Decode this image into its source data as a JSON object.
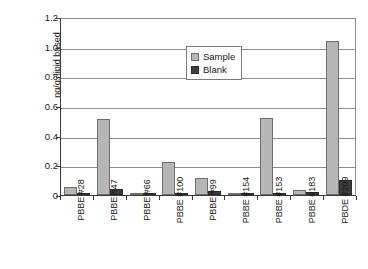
{
  "chart_data": {
    "type": "bar",
    "title": "",
    "xlabel": "",
    "ylabel": "ng/g, lipid based",
    "ylim": [
      0,
      1.2
    ],
    "yticks": [
      "0",
      "0.2",
      "0.4",
      "0.6",
      "0.8",
      "1.0",
      "1.2"
    ],
    "ytick_values": [
      0,
      0.2,
      0.4,
      0.6,
      0.8,
      1.0,
      1.2
    ],
    "grid": true,
    "legend_position": "upper center",
    "categories": [
      "PBBE #28",
      "PBBE #47",
      "PBBE #66",
      "PBBE #100",
      "PBBE #99",
      "PBBE #154",
      "PBBE #153",
      "PBBE #183",
      "PBDE #209"
    ],
    "series": [
      {
        "name": "Sample",
        "color": "#b6b6b6",
        "values": [
          0.055,
          0.512,
          0.008,
          0.221,
          0.114,
          0.012,
          0.516,
          0.033,
          1.035
        ]
      },
      {
        "name": "Blank",
        "color": "#3d3d3d",
        "values": [
          0.005,
          0.041,
          0.003,
          0.006,
          0.027,
          0.003,
          0.005,
          0.022,
          0.099
        ]
      }
    ]
  },
  "legend": {
    "items": [
      {
        "label": "Sample"
      },
      {
        "label": "Blank"
      }
    ]
  }
}
